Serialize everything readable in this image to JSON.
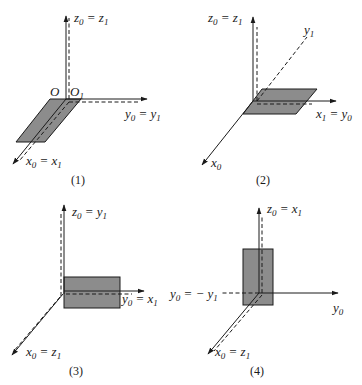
{
  "figure": {
    "panels": [
      {
        "caption": "(1)",
        "labels": {
          "z": [
            "z",
            "0",
            " = z",
            "1"
          ],
          "y": [
            "y",
            "0",
            " = y",
            "1"
          ],
          "x": [
            "x",
            "0",
            " = x",
            "1"
          ],
          "origin0": "O",
          "origin1": [
            "O",
            "1"
          ]
        }
      },
      {
        "caption": "(2)",
        "labels": {
          "z": [
            "z",
            "0",
            " = z",
            "1"
          ],
          "y1": [
            "y",
            "1"
          ],
          "x1": [
            "x",
            "1",
            " = y",
            "0"
          ],
          "x0": [
            "x",
            "0"
          ]
        }
      },
      {
        "caption": "(3)",
        "labels": {
          "z": [
            "z",
            "0",
            " = y",
            "1"
          ],
          "y": [
            "y",
            "0",
            " = x",
            "1"
          ],
          "x": [
            "x",
            "0",
            " = z",
            "1"
          ]
        }
      },
      {
        "caption": "(4)",
        "labels": {
          "z": [
            "z",
            "0",
            " = x",
            "1"
          ],
          "y1": [
            "y",
            "0",
            " = − y",
            "1"
          ],
          "y0": [
            "y",
            "0"
          ],
          "x": [
            "x",
            "0",
            " = z",
            "1"
          ]
        }
      }
    ],
    "colors": {
      "plate": "#8c8c8c",
      "ink": "#1a1a1a"
    }
  }
}
